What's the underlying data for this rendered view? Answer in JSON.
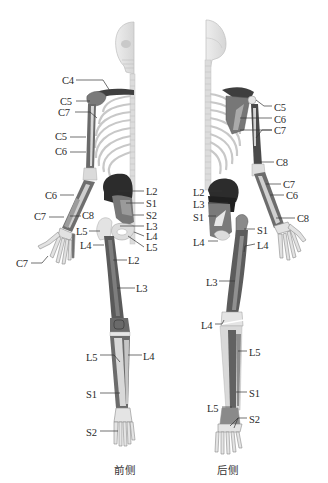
{
  "figure": {
    "views": [
      {
        "id": "front",
        "caption": "前侧"
      },
      {
        "id": "back",
        "caption": "后侧"
      }
    ],
    "colors": {
      "bone": "#e4e4e4",
      "bone_outline": "#b9b9b9",
      "muscle_dark": "#3a3a3a",
      "muscle_mid": "#6d6d6d",
      "muscle_light": "#9a9a9a",
      "label": "#2a2a2a",
      "leader": "#333333"
    },
    "front_labels": [
      {
        "text": "C4",
        "x": 62,
        "y": 75,
        "side": "l"
      },
      {
        "text": "C5",
        "x": 60,
        "y": 96,
        "side": "l"
      },
      {
        "text": "C7",
        "x": 58,
        "y": 107,
        "side": "l"
      },
      {
        "text": "C5",
        "x": 55,
        "y": 131,
        "side": "l"
      },
      {
        "text": "C6",
        "x": 55,
        "y": 146,
        "side": "l"
      },
      {
        "text": "C6",
        "x": 45,
        "y": 190,
        "side": "l"
      },
      {
        "text": "C7",
        "x": 34,
        "y": 211,
        "side": "l"
      },
      {
        "text": "C8",
        "x": 82,
        "y": 210,
        "side": "r"
      },
      {
        "text": "C7",
        "x": 16,
        "y": 258,
        "side": "l"
      },
      {
        "text": "L2",
        "x": 146,
        "y": 186,
        "side": "r"
      },
      {
        "text": "S1",
        "x": 146,
        "y": 198,
        "side": "r"
      },
      {
        "text": "S2",
        "x": 146,
        "y": 210,
        "side": "r"
      },
      {
        "text": "L3",
        "x": 146,
        "y": 221,
        "side": "r"
      },
      {
        "text": "L4",
        "x": 146,
        "y": 231,
        "side": "r"
      },
      {
        "text": "L5",
        "x": 146,
        "y": 242,
        "side": "r"
      },
      {
        "text": "L5",
        "x": 76,
        "y": 226,
        "side": "l"
      },
      {
        "text": "L4",
        "x": 80,
        "y": 240,
        "side": "l"
      },
      {
        "text": "L2",
        "x": 128,
        "y": 255,
        "side": "r"
      },
      {
        "text": "L3",
        "x": 136,
        "y": 283,
        "side": "r"
      },
      {
        "text": "L5",
        "x": 86,
        "y": 352,
        "side": "l"
      },
      {
        "text": "L4",
        "x": 143,
        "y": 351,
        "side": "r"
      },
      {
        "text": "S1",
        "x": 86,
        "y": 389,
        "side": "l"
      },
      {
        "text": "S2",
        "x": 86,
        "y": 427,
        "side": "l"
      }
    ],
    "back_labels": [
      {
        "text": "C5",
        "x": 274,
        "y": 102,
        "side": "r"
      },
      {
        "text": "C6",
        "x": 274,
        "y": 114,
        "side": "r"
      },
      {
        "text": "C7",
        "x": 274,
        "y": 125,
        "side": "r"
      },
      {
        "text": "C8",
        "x": 276,
        "y": 157,
        "side": "r"
      },
      {
        "text": "C7",
        "x": 283,
        "y": 179,
        "side": "r"
      },
      {
        "text": "C6",
        "x": 286,
        "y": 190,
        "side": "r"
      },
      {
        "text": "C8",
        "x": 297,
        "y": 213,
        "side": "r"
      },
      {
        "text": "L2",
        "x": 193,
        "y": 187,
        "side": "l"
      },
      {
        "text": "L3",
        "x": 193,
        "y": 199,
        "side": "l"
      },
      {
        "text": "S1",
        "x": 193,
        "y": 212,
        "side": "l"
      },
      {
        "text": "S1",
        "x": 257,
        "y": 225,
        "side": "r"
      },
      {
        "text": "L4",
        "x": 193,
        "y": 237,
        "side": "l"
      },
      {
        "text": "L4",
        "x": 257,
        "y": 240,
        "side": "r"
      },
      {
        "text": "L3",
        "x": 206,
        "y": 277,
        "side": "l"
      },
      {
        "text": "L4",
        "x": 201,
        "y": 320,
        "side": "l"
      },
      {
        "text": "L5",
        "x": 249,
        "y": 347,
        "side": "r"
      },
      {
        "text": "S1",
        "x": 249,
        "y": 388,
        "side": "r"
      },
      {
        "text": "L5",
        "x": 207,
        "y": 403,
        "side": "l"
      },
      {
        "text": "S2",
        "x": 249,
        "y": 414,
        "side": "r"
      }
    ]
  }
}
